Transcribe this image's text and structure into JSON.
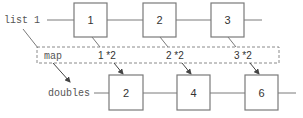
{
  "diagram": {
    "source_list": {
      "label": "list 1",
      "items": [
        "1",
        "2",
        "3"
      ]
    },
    "operation": {
      "label": "map",
      "expressions": [
        "1 *2",
        "2 *2",
        "3 *2"
      ]
    },
    "result_list": {
      "label": "doubles",
      "items": [
        "2",
        "4",
        "6"
      ]
    },
    "colors": {
      "box_stroke": "#7a7a7a",
      "dashed_stroke": "#8a8a8a",
      "arrow": "#444444",
      "text": "#333333"
    }
  }
}
